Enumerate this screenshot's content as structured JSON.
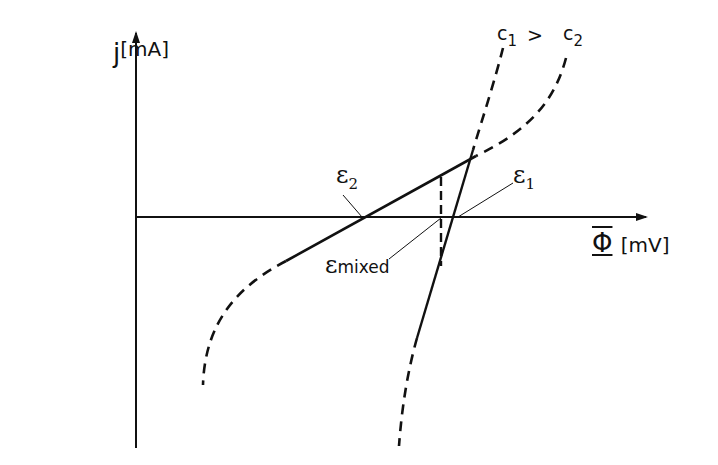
{
  "diagram": {
    "title": "",
    "axes": {
      "y": {
        "symbol": "j",
        "unit": "[mA]"
      },
      "x": {
        "symbol": "Φ",
        "unit": "[mV]"
      }
    },
    "curves": {
      "c1": {
        "label": "c",
        "subscript": "1"
      },
      "c2": {
        "label": "c",
        "subscript": "2"
      },
      "relation": ">"
    },
    "points": {
      "eps2": {
        "symbol": "ε",
        "subscript": "2"
      },
      "eps1": {
        "symbol": "ε",
        "subscript": "1"
      },
      "eps_mixed": {
        "symbol": "ε",
        "subscript": "mixed"
      }
    },
    "colors": {
      "line": "#111111",
      "background": "#ffffff"
    }
  }
}
